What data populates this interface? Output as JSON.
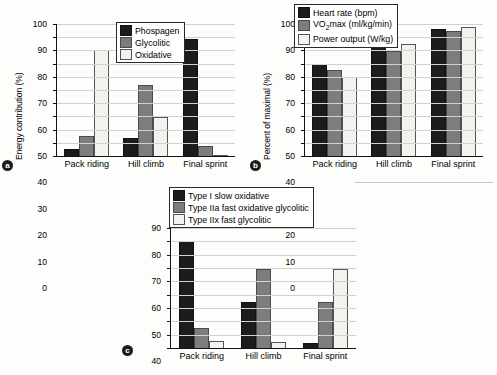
{
  "figure": {
    "panels": [
      {
        "letter": "a",
        "ylabel_prefix": "Energy contribution (%)",
        "legend": [
          "Phospagen",
          "Glycolitic",
          "Oxidative"
        ]
      },
      {
        "letter": "b",
        "ylabel_prefix": "Percent of maximal (%)",
        "legend": [
          "Heart rate (bpm)",
          "VO",
          "max (ml/kg/min)",
          "Power output (W/kg)"
        ]
      },
      {
        "letter": "c",
        "legend": [
          "Type I slow oxidative",
          "Type IIa fast oxidative glycolitic",
          "Type IIx fast glycolitic"
        ]
      }
    ]
  },
  "chart_data": [
    {
      "id": "a",
      "type": "bar",
      "title": "",
      "xlabel": "",
      "ylabel": "Energy contribution (%)",
      "ylim": [
        0,
        100
      ],
      "yticks": [
        0,
        10,
        20,
        30,
        40,
        50,
        60,
        70,
        80,
        90,
        100
      ],
      "categories": [
        "Pack riding",
        "Hill climb",
        "Final sprint"
      ],
      "grid": true,
      "legend_position": "top-center",
      "series": [
        {
          "name": "Phospagen",
          "color": "#1c1c1c",
          "values": [
            5,
            14,
            89
          ]
        },
        {
          "name": "Glycolitic",
          "color": "#7d7d7d",
          "values": [
            15,
            54,
            7.5
          ]
        },
        {
          "name": "Oxidative",
          "color": "#f2f2ef",
          "values": [
            80,
            29.5,
            1
          ]
        }
      ]
    },
    {
      "id": "b",
      "type": "bar",
      "title": "",
      "xlabel": "",
      "ylabel": "Percent of maximal (%)",
      "ylim": [
        0,
        100
      ],
      "yticks": [
        0,
        10,
        20,
        30,
        40,
        50,
        60,
        70,
        80,
        90,
        100
      ],
      "categories": [
        "Pack riding",
        "Hill climb",
        "Final sprint"
      ],
      "grid": true,
      "legend_position": "top-center",
      "series": [
        {
          "name": "Heart rate (bpm)",
          "color": "#1c1c1c",
          "values": [
            70,
            82.5,
            96.5
          ]
        },
        {
          "name": "VO2max (ml/kg/min)",
          "color": "#7d7d7d",
          "values": [
            65,
            79.5,
            94.5
          ]
        },
        {
          "name": "Power output (W/kg)",
          "color": "#f2f2ef",
          "values": [
            60,
            85,
            97.5
          ]
        }
      ]
    },
    {
      "id": "c",
      "type": "bar",
      "title": "",
      "xlabel": "",
      "ylabel": "",
      "ylim": [
        0,
        90
      ],
      "yticks": [
        0,
        10,
        20,
        30,
        40,
        50,
        60,
        70,
        80,
        90
      ],
      "categories": [
        "Pack riding",
        "Hill climb",
        "Final sprint"
      ],
      "grid": true,
      "legend_position": "top-center",
      "series": [
        {
          "name": "Type I slow oxidative",
          "color": "#1c1c1c",
          "values": [
            80,
            34.5,
            4
          ]
        },
        {
          "name": "Type IIa fast oxidative glycolitic",
          "color": "#7d7d7d",
          "values": [
            15,
            59.5,
            34.5
          ]
        },
        {
          "name": "Type IIx fast glycolitic",
          "color": "#f2f2ef",
          "values": [
            5,
            4.5,
            59.5
          ]
        }
      ]
    }
  ]
}
